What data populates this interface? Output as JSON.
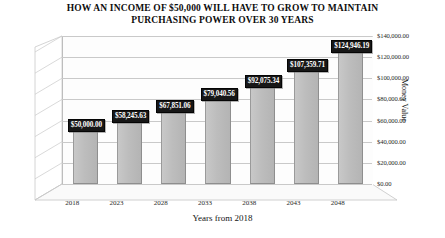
{
  "chart_data": {
    "type": "bar",
    "title": "HOW AN INCOME OF $50,000 WILL HAVE TO GROW TO MAINTAIN PURCHASING POWER OVER 30 YEARS",
    "title_line1": "HOW AN INCOME OF $50,000 WILL HAVE TO GROW TO MAINTAIN",
    "title_line2": "PURCHASING POWER OVER 30 YEARS",
    "xlabel": "Years from 2018",
    "ylabel": "Money Value",
    "categories": [
      "2018",
      "2023",
      "2028",
      "2033",
      "2038",
      "2043",
      "2048"
    ],
    "values": [
      50000.0,
      58245.63,
      67851.06,
      79040.56,
      92075.34,
      107359.71,
      124946.19
    ],
    "data_labels": [
      "$50,000.00",
      "$58,245.63",
      "$67,851.06",
      "$79,040.56",
      "$92,075.34",
      "$107,359.71",
      "$124,946.19"
    ],
    "ylim": [
      0,
      140000
    ],
    "yticks": [
      0,
      20000,
      40000,
      60000,
      80000,
      100000,
      120000,
      140000
    ],
    "ytick_labels": [
      "$0.00",
      "$20,000.00",
      "$40,000.00",
      "$60,000.00",
      "$80,000.00",
      "$100,000.00",
      "$120,000.00",
      "$140,000.00"
    ],
    "grid": true,
    "legend": false,
    "style": "3d-column",
    "colors": {
      "bar_front": "#bdbdbd",
      "bar_side": "#9b9b9b",
      "bar_top": "#d6d6d6",
      "gridline": "#c9c9c9",
      "label_background": "#171717",
      "label_text": "#ffffff",
      "plot_background": "#fdfdfd",
      "text": "#141414"
    }
  }
}
